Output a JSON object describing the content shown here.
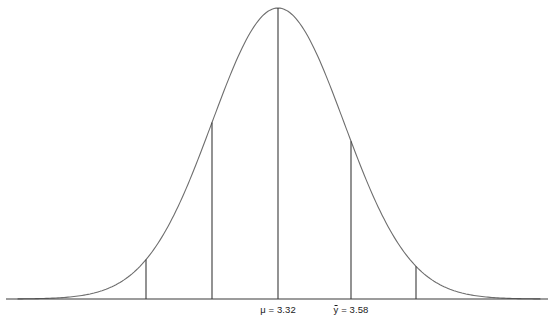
{
  "figure": {
    "title": "",
    "background_color": "#ffffff",
    "curve_color": "#6e6e6e",
    "axis_color": "#3a3a3a",
    "marker_color": "#3a3a3a",
    "text_color": "#1a1a1a",
    "width": 557,
    "height": 333
  },
  "labels": {
    "mu": "μ = 3.32",
    "mu_symbol": "μ",
    "ybar_prefix": "y",
    "ybar_suffix": " = 3.58",
    "ybar_full": "ȳ = 3.58"
  },
  "chart_data": {
    "type": "line",
    "title": "",
    "subtitle": "",
    "xlabel": "",
    "ylabel": "",
    "grid": false,
    "legend": null,
    "distribution": {
      "shape": "normal",
      "mean_label": "μ = 3.32",
      "mean_value": 3.32,
      "sample_mean_label": "ȳ = 3.58",
      "sample_mean_value": 3.58,
      "sd_step_value": 0.26,
      "peak_x_px": 278,
      "peak_y_px": 8,
      "baseline_y_px": 299,
      "sd_px": 66
    },
    "axis": {
      "x_start_px": 6,
      "x_end_px": 548,
      "y_px": 299,
      "ticks": [],
      "tick_labels": []
    },
    "markers": [
      {
        "name": "minus-two-sd",
        "x_px": 146,
        "z": -2,
        "value": 2.8,
        "top_y_px": 258,
        "label": ""
      },
      {
        "name": "minus-one-sd",
        "x_px": 212,
        "z": -1,
        "value": 3.06,
        "top_y_px": 128,
        "label": ""
      },
      {
        "name": "mean",
        "x_px": 278,
        "z": 0,
        "value": 3.32,
        "top_y_px": 9,
        "label": "μ = 3.32"
      },
      {
        "name": "sample-mean-plus-one-sd",
        "x_px": 351,
        "z": 1,
        "value": 3.58,
        "top_y_px": 130,
        "label": "ȳ = 3.58"
      },
      {
        "name": "plus-two-sd",
        "x_px": 416,
        "z": 2,
        "value": 3.84,
        "top_y_px": 261,
        "label": ""
      }
    ],
    "curve_points_px": [
      [
        20,
        298.8
      ],
      [
        40,
        298.4
      ],
      [
        55,
        297.6
      ],
      [
        70,
        296.2
      ],
      [
        85,
        293.6
      ],
      [
        100,
        289.2
      ],
      [
        115,
        282.4
      ],
      [
        130,
        272.4
      ],
      [
        146,
        258.0
      ],
      [
        160,
        242.0
      ],
      [
        175,
        221.0
      ],
      [
        190,
        196.0
      ],
      [
        205,
        168.0
      ],
      [
        212,
        128.0
      ],
      [
        225,
        110.0
      ],
      [
        240,
        76.0
      ],
      [
        255,
        44.0
      ],
      [
        265,
        26.0
      ],
      [
        278,
        9.0
      ],
      [
        291,
        24.0
      ],
      [
        305,
        50.0
      ],
      [
        320,
        84.0
      ],
      [
        335,
        118.0
      ],
      [
        351,
        130.0
      ],
      [
        365,
        175.0
      ],
      [
        380,
        205.0
      ],
      [
        395,
        233.0
      ],
      [
        416,
        261.0
      ],
      [
        430,
        277.0
      ],
      [
        445,
        287.0
      ],
      [
        460,
        293.0
      ],
      [
        475,
        296.4
      ],
      [
        490,
        298.0
      ],
      [
        510,
        298.7
      ],
      [
        535,
        299.0
      ]
    ]
  }
}
